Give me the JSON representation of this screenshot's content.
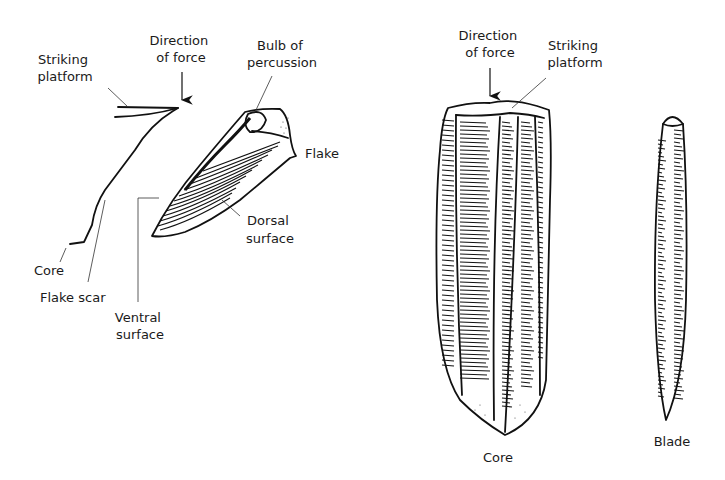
{
  "left_diagram": {
    "name": "flake-removal",
    "labels": {
      "striking_platform": [
        "Striking",
        "platform"
      ],
      "direction_of_force": [
        "Direction",
        "of force"
      ],
      "bulb_of_percussion": [
        "Bulb of",
        "percussion"
      ],
      "flake": [
        "Flake"
      ],
      "dorsal_surface": [
        "Dorsal",
        "surface"
      ],
      "core": [
        "Core"
      ],
      "flake_scar": [
        "Flake scar"
      ],
      "ventral_surface": [
        "Ventral",
        "surface"
      ]
    }
  },
  "right_diagram": {
    "name": "blade-core",
    "labels": {
      "direction_of_force": [
        "Direction",
        "of force"
      ],
      "striking_platform": [
        "Striking",
        "platform"
      ],
      "core": [
        "Core"
      ],
      "blade": [
        "Blade"
      ]
    }
  },
  "colors": {
    "ink": "#111111",
    "background": "#ffffff"
  }
}
